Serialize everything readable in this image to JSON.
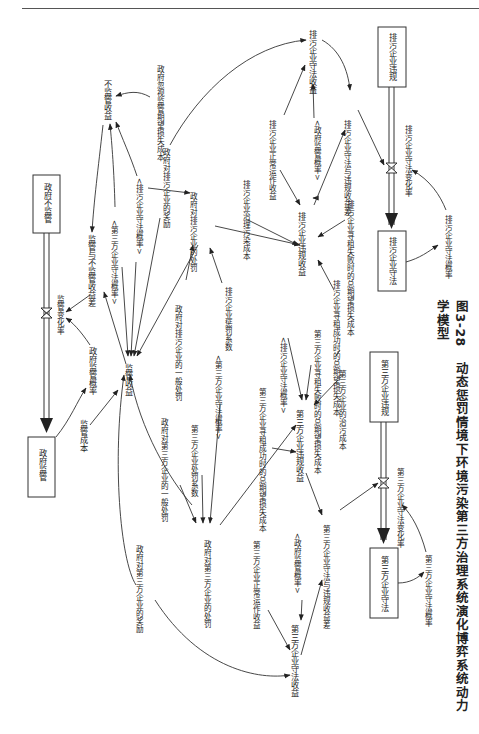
{
  "page": {
    "header_text": "· · ·",
    "caption_number": "图3-28",
    "caption_title": "动态惩罚情境下环境污染第三方治理系统演化博弈系统动力学模型"
  },
  "stocks": {
    "gov_no_supervise": "政府不监管",
    "gov_supervise": "政府监管",
    "polluter_violate": "排污企业违规",
    "polluter_comply": "排污企业守法",
    "third_violate": "第三方企业违规",
    "third_comply": "第三方企业守法"
  },
  "flows": {
    "supervise_rate": "监管变化率",
    "polluter_rate": "排污企业守法变化率",
    "third_rate": "第三方企业守法变化率"
  },
  "variables": {
    "no_supervise_income": "不监管收益",
    "gov_neglect_loss": "政府忽视监管期望损失成本",
    "supervise_diff": "监管与不监管收益差",
    "gov_supervise_prob": "政府监管概率",
    "supervise_income": "监管收益",
    "supervise_cost": "监管成本",
    "third_comply_prob_shadow1": "<第三方企业守法概率>",
    "polluter_comply_prob_shadow1": "<排污企业守法概率>",
    "gov_reward_polluter": "政府对排污企业的奖励",
    "gov_punish_polluter": "政府对排污企业的处罚",
    "gov_general_punish_polluter": "政府对排污企业的一般处罚",
    "polluter_punish_coef": "排污企业惩罚系数",
    "third_comply_prob_shadow2": "<第三方企业守法概率>",
    "gov_general_punish_third": "政府对第三方企业的一般处罚",
    "third_punish_coef": "第三方企业处罚系数",
    "gov_punish_third": "政府对第三方企业的处罚",
    "gov_reward_third": "政府对第三方企业的奖励",
    "polluter_normal_income": "排污企业正常运作收益",
    "gov_supervise_prob_shadow1": "<政府监管概率>",
    "polluter_comply_income": "排污企业守法收益",
    "polluter_income_diff": "排污企业守法与违规收益差",
    "polluter_treat_cost": "排污企业治理污染成本",
    "polluter_violate_income": "排污企业违规收益",
    "polluter_rent_fail_loss": "排污企业寻租失败时的总期望损失成本",
    "polluter_rent_success_loss": "排污企业寻租成功时的总期望损失成本",
    "polluter_comply_prob": "排污企业守法概率",
    "polluter_comply_prob_shadow2": "<排污企业守法概率>",
    "third_rent_fail_loss": "第三方企业寻租失败时的总期望损失成本",
    "third_rent_success_loss": "第三方企业寻租成功时的总期望损失成本",
    "third_treat_cost": "第三方企业的治污成本",
    "third_violate_income": "第三方企业违规收益",
    "third_normal_income": "第三方企业正常运作收益",
    "gov_supervise_prob_shadow2": "<政府监管概率>",
    "third_comply_income": "第三方企业守法收益",
    "third_income_diff": "第三方企业守法与违规收益差",
    "third_comply_prob": "第三方企业守法概率"
  }
}
